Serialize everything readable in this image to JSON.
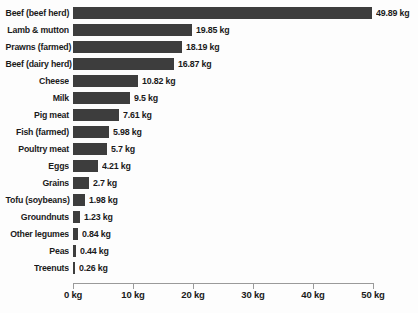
{
  "chart_data": {
    "type": "bar",
    "orientation": "horizontal",
    "title": "",
    "subtitle": "",
    "xlabel": "",
    "ylabel": "",
    "xlim": [
      0,
      50
    ],
    "grid": false,
    "legend": null,
    "unit": "kg",
    "bar_color": "#3d3d3d",
    "axis_color": "#9a9a9a",
    "text_color": "#1a1a1a",
    "background": "#fdfdfd",
    "categories": [
      "Beef (beef herd)",
      "Lamb & mutton",
      "Prawns (farmed)",
      "Beef (dairy herd)",
      "Cheese",
      "Milk",
      "Pig meat",
      "Fish (farmed)",
      "Poultry meat",
      "Eggs",
      "Grains",
      "Tofu (soybeans)",
      "Groundnuts",
      "Other legumes",
      "Peas",
      "Treenuts"
    ],
    "values": [
      49.89,
      19.85,
      18.19,
      16.87,
      10.82,
      9.5,
      7.61,
      5.98,
      5.7,
      4.21,
      2.7,
      1.98,
      1.23,
      0.84,
      0.44,
      0.26
    ],
    "value_labels": [
      "49.89 kg",
      "19.85 kg",
      "18.19 kg",
      "16.87 kg",
      "10.82 kg",
      "9.5 kg",
      "7.61 kg",
      "5.98 kg",
      "5.7 kg",
      "4.21 kg",
      "2.7 kg",
      "1.98 kg",
      "1.23 kg",
      "0.84 kg",
      "0.44 kg",
      "0.26 kg"
    ],
    "xticks": [
      0,
      10,
      20,
      30,
      40,
      50
    ],
    "xtick_labels": [
      "0 kg",
      "10 kg",
      "20 kg",
      "30 kg",
      "40 kg",
      "50 kg"
    ]
  }
}
